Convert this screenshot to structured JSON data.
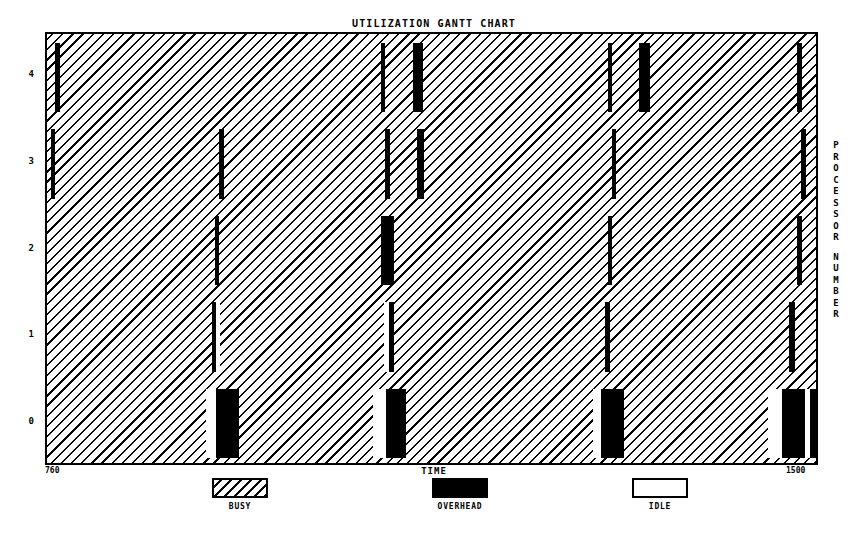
{
  "chart_data": {
    "type": "bar",
    "subtype": "gantt",
    "title": "UTILIZATION GANTT CHART",
    "xlabel": "TIME",
    "ylabel": "PROCESSOR NUMBER",
    "xlim": [
      760,
      1500
    ],
    "ylim": [
      0,
      4
    ],
    "xticks": [
      "760",
      "1500"
    ],
    "yticks": [
      "0",
      "1",
      "2",
      "3",
      "4"
    ],
    "grid": false,
    "legend_position": "below",
    "legend": [
      {
        "label": "BUSY",
        "pattern": "hatch",
        "color": "#000000"
      },
      {
        "label": "OVERHEAD",
        "pattern": "solid",
        "color": "#000000"
      },
      {
        "label": "IDLE",
        "pattern": "empty",
        "color": "#ffffff"
      }
    ],
    "series": [
      {
        "name": "PROCESSOR 4",
        "row": 4,
        "segments": [
          {
            "state": "OVERHEAD",
            "start": 768,
            "end": 772
          },
          {
            "state": "BUSY",
            "start": 772,
            "end": 1080
          },
          {
            "state": "OVERHEAD",
            "start": 1080,
            "end": 1084
          },
          {
            "state": "BUSY",
            "start": 1084,
            "end": 1110
          },
          {
            "state": "OVERHEAD",
            "start": 1110,
            "end": 1120
          },
          {
            "state": "BUSY",
            "start": 1120,
            "end": 1297
          },
          {
            "state": "OVERHEAD",
            "start": 1297,
            "end": 1301
          },
          {
            "state": "BUSY",
            "start": 1301,
            "end": 1327
          },
          {
            "state": "OVERHEAD",
            "start": 1327,
            "end": 1337
          },
          {
            "state": "BUSY",
            "start": 1337,
            "end": 1478
          },
          {
            "state": "OVERHEAD",
            "start": 1478,
            "end": 1483
          },
          {
            "state": "BUSY",
            "start": 1483,
            "end": 1500
          }
        ]
      },
      {
        "name": "PROCESSOR 3",
        "row": 3,
        "segments": [
          {
            "state": "OVERHEAD",
            "start": 764,
            "end": 768
          },
          {
            "state": "BUSY",
            "start": 768,
            "end": 925
          },
          {
            "state": "OVERHEAD",
            "start": 925,
            "end": 929
          },
          {
            "state": "BUSY",
            "start": 929,
            "end": 1084
          },
          {
            "state": "OVERHEAD",
            "start": 1084,
            "end": 1088
          },
          {
            "state": "BUSY",
            "start": 1088,
            "end": 1114
          },
          {
            "state": "OVERHEAD",
            "start": 1114,
            "end": 1121
          },
          {
            "state": "BUSY",
            "start": 1121,
            "end": 1301
          },
          {
            "state": "OVERHEAD",
            "start": 1301,
            "end": 1305
          },
          {
            "state": "BUSY",
            "start": 1305,
            "end": 1482
          },
          {
            "state": "OVERHEAD",
            "start": 1482,
            "end": 1487
          },
          {
            "state": "BUSY",
            "start": 1487,
            "end": 1500
          }
        ]
      },
      {
        "name": "PROCESSOR 2",
        "row": 2,
        "segments": [
          {
            "state": "BUSY",
            "start": 760,
            "end": 921
          },
          {
            "state": "OVERHEAD",
            "start": 921,
            "end": 925
          },
          {
            "state": "BUSY",
            "start": 925,
            "end": 1080
          },
          {
            "state": "OVERHEAD",
            "start": 1080,
            "end": 1092
          },
          {
            "state": "BUSY",
            "start": 1092,
            "end": 1297
          },
          {
            "state": "OVERHEAD",
            "start": 1297,
            "end": 1301
          },
          {
            "state": "BUSY",
            "start": 1301,
            "end": 1478
          },
          {
            "state": "OVERHEAD",
            "start": 1478,
            "end": 1483
          },
          {
            "state": "BUSY",
            "start": 1483,
            "end": 1500
          }
        ]
      },
      {
        "name": "PROCESSOR 1",
        "row": 1,
        "segments": [
          {
            "state": "BUSY",
            "start": 760,
            "end": 918
          },
          {
            "state": "OVERHEAD",
            "start": 918,
            "end": 922
          },
          {
            "state": "IDLE",
            "start": 922,
            "end": 926
          },
          {
            "state": "BUSY",
            "start": 926,
            "end": 1083
          },
          {
            "state": "IDLE",
            "start": 1083,
            "end": 1087
          },
          {
            "state": "OVERHEAD",
            "start": 1087,
            "end": 1092
          },
          {
            "state": "BUSY",
            "start": 1092,
            "end": 1294
          },
          {
            "state": "OVERHEAD",
            "start": 1294,
            "end": 1299
          },
          {
            "state": "BUSY",
            "start": 1299,
            "end": 1470
          },
          {
            "state": "OVERHEAD",
            "start": 1470,
            "end": 1476
          },
          {
            "state": "BUSY",
            "start": 1476,
            "end": 1500
          }
        ]
      },
      {
        "name": "PROCESSOR 0",
        "row": 0,
        "segments": [
          {
            "state": "BUSY",
            "start": 760,
            "end": 912
          },
          {
            "state": "IDLE",
            "start": 912,
            "end": 922
          },
          {
            "state": "OVERHEAD",
            "start": 922,
            "end": 944
          },
          {
            "state": "BUSY",
            "start": 944,
            "end": 1072
          },
          {
            "state": "IDLE",
            "start": 1072,
            "end": 1085
          },
          {
            "state": "OVERHEAD",
            "start": 1085,
            "end": 1104
          },
          {
            "state": "BUSY",
            "start": 1104,
            "end": 1283
          },
          {
            "state": "IDLE",
            "start": 1283,
            "end": 1290
          },
          {
            "state": "OVERHEAD",
            "start": 1290,
            "end": 1312
          },
          {
            "state": "BUSY",
            "start": 1312,
            "end": 1450
          },
          {
            "state": "IDLE",
            "start": 1450,
            "end": 1464
          },
          {
            "state": "OVERHEAD",
            "start": 1464,
            "end": 1486
          },
          {
            "state": "IDLE",
            "start": 1486,
            "end": 1490
          },
          {
            "state": "OVERHEAD",
            "start": 1490,
            "end": 1497
          }
        ]
      }
    ]
  },
  "yaxis_title_letters": [
    "P",
    "R",
    "O",
    "C",
    "E",
    "S",
    "S",
    "O",
    "R",
    "",
    "N",
    "U",
    "M",
    "B",
    "E",
    "R"
  ]
}
